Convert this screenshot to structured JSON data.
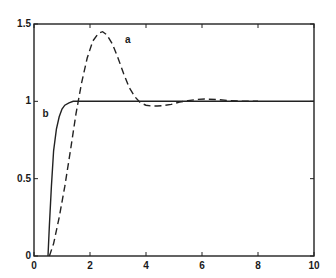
{
  "chart_data": {
    "type": "line",
    "title": "",
    "xlabel": "",
    "ylabel": "",
    "xlim": [
      0,
      10
    ],
    "ylim": [
      0,
      1.5
    ],
    "grid": false,
    "legend": "none (curves labeled inline)",
    "x_ticks": [
      "0",
      "2",
      "4",
      "6",
      "8",
      "10"
    ],
    "y_ticks": [
      "0",
      "0.5",
      "1",
      "1.5"
    ],
    "series": [
      {
        "name": "a",
        "style": "dashed",
        "x": [
          0.55,
          0.7,
          0.9,
          1.1,
          1.3,
          1.5,
          1.7,
          1.9,
          2.1,
          2.3,
          2.45,
          2.6,
          2.8,
          3.0,
          3.2,
          3.4,
          3.6,
          3.8,
          4.0,
          4.2,
          4.4,
          4.6,
          4.9,
          5.2,
          5.5,
          5.8,
          6.1,
          6.5,
          7.0,
          7.5,
          8.0
        ],
        "values": [
          0.0,
          0.08,
          0.25,
          0.45,
          0.68,
          0.92,
          1.12,
          1.28,
          1.39,
          1.44,
          1.45,
          1.43,
          1.37,
          1.28,
          1.18,
          1.09,
          1.03,
          0.99,
          0.975,
          0.97,
          0.97,
          0.972,
          0.98,
          0.995,
          1.005,
          1.012,
          1.015,
          1.012,
          1.005,
          1.0,
          1.0
        ]
      },
      {
        "name": "b",
        "style": "solid",
        "x": [
          0.5,
          0.55,
          0.62,
          0.7,
          0.8,
          0.9,
          1.0,
          1.1,
          1.25,
          1.4,
          1.6,
          2.0,
          4.0,
          6.0,
          8.0,
          10.0
        ],
        "values": [
          0.0,
          0.2,
          0.45,
          0.68,
          0.82,
          0.9,
          0.95,
          0.975,
          0.99,
          1.0,
          1.0,
          1.0,
          1.0,
          1.0,
          1.0,
          1.0
        ]
      }
    ],
    "annotations": [
      {
        "text": "a",
        "x": 3.25,
        "y": 1.38
      },
      {
        "text": "b",
        "x": 0.3,
        "y": 0.9
      }
    ]
  }
}
